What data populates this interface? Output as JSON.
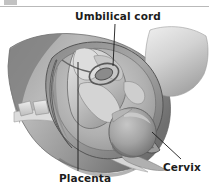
{
  "figure": {
    "type": "anatomical-illustration",
    "style": "grayscale medical illustration",
    "width": 209,
    "height": 187,
    "background_color": "#ffffff",
    "label_color": "#1c1c1c",
    "leader_line_color": "#1a1a1a"
  },
  "labels": {
    "umbilical_cord": "Umbilical cord",
    "placenta": "Placenta",
    "cervix": "Cervix"
  },
  "callouts": [
    {
      "name": "umbilical-cord",
      "text": "Umbilical cord",
      "label_x": 75,
      "label_y": 11,
      "leader": {
        "x1": 115,
        "y1": 24,
        "x2": 113,
        "y2": 66
      }
    },
    {
      "name": "placenta",
      "text": "Placenta",
      "label_x": 59,
      "label_y": 173,
      "leader": {
        "x1": 78,
        "y1": 62,
        "x2": 78,
        "y2": 171
      }
    },
    {
      "name": "cervix",
      "text": "Cervix",
      "label_x": 163,
      "label_y": 162,
      "leader": {
        "x1": 152,
        "y1": 132,
        "x2": 181,
        "y2": 159
      }
    }
  ],
  "anatomy_parts": [
    "maternal-abdomen-outline",
    "uterine-wall",
    "amniotic-cavity",
    "placenta-mass",
    "umbilical-cord-coil",
    "fetus-head",
    "fetus-body",
    "maternal-spine-vertebrae",
    "sacrum",
    "cervix-canal",
    "maternal-thigh"
  ],
  "palette": {
    "background": "#ffffff",
    "skin_light": "#d8d8d8",
    "skin_mid": "#b4b4b4",
    "skin_dark": "#8a8a8a",
    "shadow": "#6d6d6d",
    "deep_shadow": "#4f4f4f",
    "bone_light": "#e6e6e6",
    "bone_mid": "#c9c9c9",
    "outline": "#5a5a5a",
    "text": "#1c1c1c"
  }
}
